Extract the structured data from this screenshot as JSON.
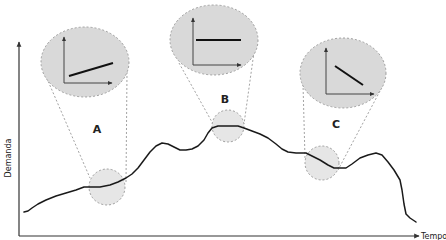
{
  "diagram": {
    "axes": {
      "y_label": "Demanda",
      "x_label": "Tempo"
    },
    "zoom_callouts": [
      {
        "id": "A",
        "label": "A",
        "trend": "increasing"
      },
      {
        "id": "B",
        "label": "B",
        "trend": "flat"
      },
      {
        "id": "C",
        "label": "C",
        "trend": "decreasing"
      }
    ],
    "colors": {
      "curve": "#1a1a1a",
      "axis": "#333333",
      "ellipse_fill": "#d9d9d9",
      "small_circle_fill": "#e6e6e6",
      "dashed": "#8a8a8a"
    }
  }
}
